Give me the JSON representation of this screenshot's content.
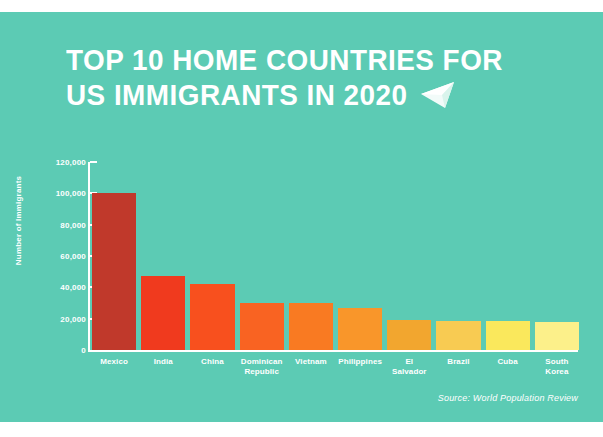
{
  "title": {
    "line1": "TOP 10 HOME COUNTRIES FOR",
    "line2": "US IMMIGRANTS IN 2020",
    "icon": "paper-plane-icon"
  },
  "source": "Source: World Population Review",
  "theme": {
    "background": "#5CCBB4",
    "text": "#FFFFFF",
    "outer_margin": "#FFFFFF"
  },
  "chart_data": {
    "type": "bar",
    "title": "TOP 10 HOME COUNTRIES FOR US IMMIGRANTS IN 2020",
    "xlabel": "",
    "ylabel": "Number of Immigrants",
    "ylim": [
      0,
      120000
    ],
    "ytick_labels": [
      "120,000",
      "100,000",
      "80,000",
      "60,000",
      "40,000",
      "20,000",
      "0"
    ],
    "ytick_values": [
      120000,
      100000,
      80000,
      60000,
      40000,
      20000,
      0
    ],
    "grid": false,
    "legend": false,
    "categories": [
      "Mexico",
      "India",
      "China",
      "Dominican Republic",
      "Vietnam",
      "Philippines",
      "El Salvador",
      "Brazil",
      "Cuba",
      "South Korea"
    ],
    "category_lines": [
      [
        "Mexico"
      ],
      [
        "India"
      ],
      [
        "China"
      ],
      [
        "Dominican",
        "Republic"
      ],
      [
        "Vietnam"
      ],
      [
        "Philippines"
      ],
      [
        "El",
        "Salvador"
      ],
      [
        "Brazil"
      ],
      [
        "Cuba"
      ],
      [
        "South",
        "Korea"
      ]
    ],
    "values": [
      100000,
      47000,
      42000,
      30000,
      30000,
      27000,
      19000,
      18500,
      18500,
      18000
    ],
    "colors": [
      "#C0392B",
      "#F03A1E",
      "#F8501E",
      "#F96322",
      "#F97A22",
      "#F9962A",
      "#F2A62F",
      "#F8CB52",
      "#FAE85C",
      "#FCF08A"
    ]
  }
}
